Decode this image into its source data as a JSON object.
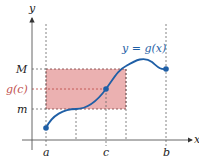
{
  "diagram": {
    "type": "mean-value-theorem-illustration",
    "axes": {
      "x_label": "x",
      "y_label": "y"
    },
    "curve": {
      "label": "y = g(x)",
      "color": "#1f5fa6"
    },
    "x_ticks": [
      {
        "label": "a"
      },
      {
        "label": "c"
      },
      {
        "label": "b"
      }
    ],
    "y_ticks": [
      {
        "label": "M"
      },
      {
        "label": "g(c)"
      },
      {
        "label": "m"
      }
    ],
    "rectangle": {
      "fill": "#e8a3a3",
      "border": "#7a3a3a"
    },
    "colors": {
      "axis": "#555555",
      "guide": "#666666",
      "gc_line": "#c0504d",
      "gc_label": "#c0504d"
    }
  }
}
